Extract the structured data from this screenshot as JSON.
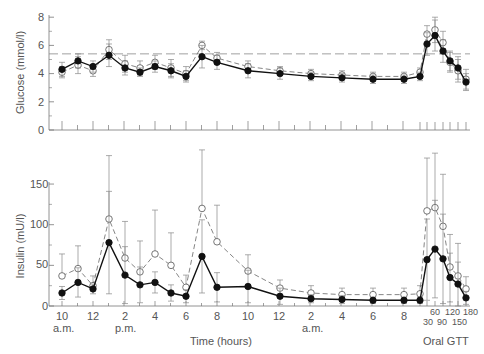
{
  "chart_data": [
    {
      "type": "line",
      "panel": "top",
      "title": "",
      "ylabel": "Glucose (mmol/l)",
      "xlabel": "Time (hours)",
      "ylim": [
        0,
        8
      ],
      "yticks": [
        0,
        2,
        4,
        6,
        8
      ],
      "reference_line": 5.4,
      "x": [
        "10 a.m.",
        "11",
        "12",
        "1 p.m.",
        "2 p.m.",
        "3",
        "4",
        "5",
        "6",
        "7",
        "8",
        "10",
        "12",
        "2 a.m.",
        "4",
        "6",
        "8",
        "GTT 0",
        "GTT 30",
        "GTT 60",
        "GTT 90",
        "GTT 120",
        "GTT 150",
        "GTT 180"
      ],
      "series": [
        {
          "name": "filled",
          "marker": "filled-circle",
          "line": "solid",
          "values": [
            4.3,
            4.9,
            4.5,
            5.3,
            4.4,
            4.1,
            4.5,
            4.2,
            3.8,
            5.2,
            4.8,
            4.2,
            4.0,
            3.8,
            3.7,
            3.6,
            3.6,
            3.8,
            6.1,
            6.7,
            5.6,
            4.9,
            4.4,
            3.4
          ],
          "err": [
            0.5,
            0.5,
            0.4,
            0.8,
            0.5,
            0.3,
            0.4,
            0.5,
            0.4,
            0.8,
            0.5,
            0.5,
            0.4,
            0.3,
            0.3,
            0.3,
            0.3,
            0.3,
            0.8,
            1.1,
            0.8,
            0.7,
            0.8,
            0.6
          ]
        },
        {
          "name": "open",
          "marker": "open-circle",
          "line": "dashed",
          "values": [
            4.1,
            4.6,
            4.2,
            5.7,
            4.7,
            4.4,
            4.8,
            4.4,
            4.0,
            6.0,
            5.1,
            4.5,
            4.2,
            4.0,
            3.9,
            3.8,
            3.8,
            4.1,
            6.8,
            7.1,
            6.2,
            4.8,
            4.2,
            3.6
          ],
          "err": [
            0.4,
            0.6,
            0.4,
            0.7,
            0.6,
            0.5,
            0.5,
            0.6,
            0.5,
            0.3,
            0.4,
            0.4,
            0.3,
            0.3,
            0.3,
            0.3,
            0.3,
            0.3,
            0.6,
            0.9,
            0.8,
            0.7,
            0.8,
            0.7
          ]
        }
      ]
    },
    {
      "type": "line",
      "panel": "bottom",
      "title": "",
      "ylabel": "Insulin (mU/l)",
      "xlabel": "Time (hours)",
      "ylim": [
        0,
        150
      ],
      "yticks": [
        0,
        50,
        100,
        150
      ],
      "x": [
        "10 a.m.",
        "11",
        "12",
        "1 p.m.",
        "2 p.m.",
        "3",
        "4",
        "5",
        "6",
        "7",
        "8",
        "10",
        "12",
        "2 a.m.",
        "4",
        "6",
        "8",
        "GTT 0",
        "GTT 30",
        "GTT 60",
        "GTT 90",
        "GTT 120",
        "GTT 150",
        "GTT 180"
      ],
      "series": [
        {
          "name": "filled",
          "marker": "filled-circle",
          "line": "solid",
          "values": [
            16,
            29,
            21,
            78,
            38,
            26,
            29,
            16,
            12,
            61,
            23,
            24,
            12,
            9,
            8,
            7,
            7,
            7,
            57,
            70,
            58,
            35,
            27,
            10
          ],
          "err": [
            8,
            18,
            6,
            63,
            35,
            22,
            13,
            10,
            8,
            45,
            18,
            20,
            10,
            5,
            5,
            4,
            4,
            4,
            50,
            60,
            55,
            30,
            27,
            8
          ]
        },
        {
          "name": "open",
          "marker": "open-circle",
          "line": "dashed",
          "values": [
            37,
            46,
            25,
            107,
            59,
            42,
            64,
            50,
            23,
            120,
            79,
            43,
            22,
            16,
            14,
            14,
            14,
            15,
            117,
            121,
            98,
            48,
            37,
            21
          ],
          "err": [
            27,
            28,
            12,
            78,
            45,
            38,
            54,
            40,
            15,
            72,
            45,
            20,
            10,
            9,
            8,
            8,
            8,
            10,
            65,
            67,
            64,
            40,
            40,
            15
          ]
        }
      ]
    }
  ],
  "axes": {
    "glucose_label": "Glucose (mmol/l)",
    "insulin_label": "Insulin (mU/l)",
    "glucose_ticks": [
      "8",
      "6",
      "4",
      "2",
      "0"
    ],
    "insulin_ticks": [
      "150",
      "100",
      "50",
      "0"
    ],
    "x_ticks": [
      "10",
      "12",
      "2",
      "4",
      "6",
      "8",
      "10",
      "12",
      "2",
      "4",
      "6",
      "8"
    ],
    "x_sublabels": [
      "a.m.",
      "p.m.",
      "a.m."
    ],
    "gtt_ticks_top": [
      "60",
      "120",
      "180"
    ],
    "gtt_ticks_bottom": [
      "30",
      "90",
      "150"
    ],
    "xlabel": "Time (hours)",
    "gtt_label": "Oral GTT"
  }
}
